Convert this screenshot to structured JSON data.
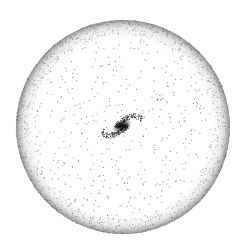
{
  "image": {
    "description": "Stippled illustration of a spiral galaxy at the center of a large spherical halo",
    "background": "#ffffff",
    "ink": "#1a1a1a"
  },
  "halo": {
    "cx": 123,
    "cy": 127,
    "r": 107,
    "rim_color": "#333333",
    "dot_count": 520,
    "rim_dot_count": 1400
  },
  "galaxy": {
    "cx": 122,
    "cy": 126,
    "rx": 20,
    "ry": 8,
    "tilt_deg": -25,
    "core_color": "#111111"
  }
}
